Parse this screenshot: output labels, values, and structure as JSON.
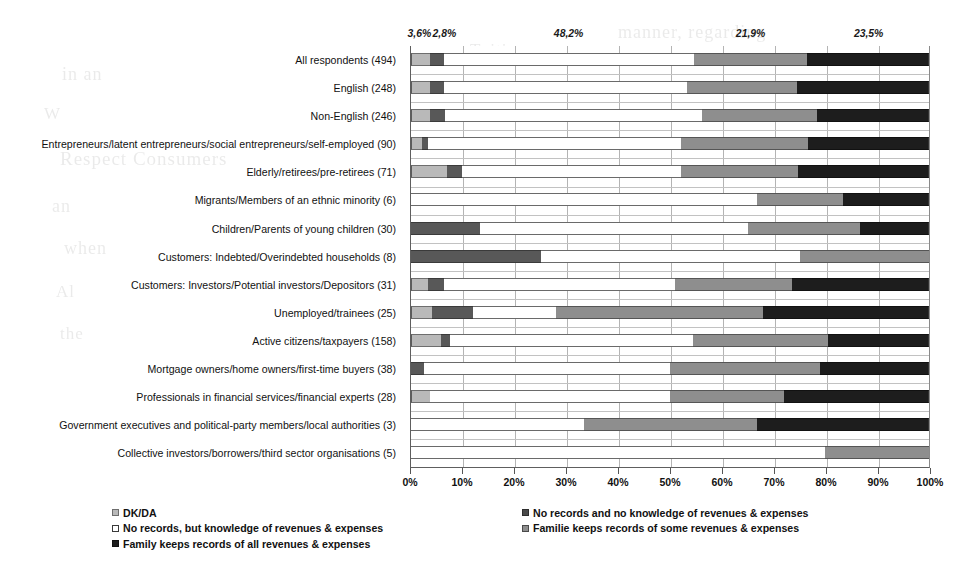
{
  "chart_data": {
    "type": "bar",
    "orientation": "horizontal",
    "stacked": true,
    "stack_mode": "percent",
    "title": "",
    "xlabel": "",
    "ylabel": "",
    "xlim": [
      0,
      100
    ],
    "xticks": [
      0,
      10,
      20,
      30,
      40,
      50,
      60,
      70,
      80,
      90,
      100
    ],
    "xtick_labels": [
      "0%",
      "10%",
      "20%",
      "30%",
      "40%",
      "50%",
      "60%",
      "70%",
      "80%",
      "90%",
      "100%"
    ],
    "grid": true,
    "legend_position": "bottom",
    "legend_entries": [
      "DK/DA",
      "No records and no knowledge of revenues & expenses",
      "No records, but knowledge of revenues & expenses",
      "Familie keeps records of some revenues & expenses",
      "Family keeps records of all revenues & expenses"
    ],
    "categories": [
      "All respondents (494)",
      "English (248)",
      "Non-English (246)",
      "Entrepreneurs/latent entrepreneurs/social entrepreneurs/self-employed (90)",
      "Elderly/retirees/pre-retirees (71)",
      "Migrants/Members of an ethnic minority (6)",
      "Children/Parents of young children (30)",
      "Customers: Indebted/Overindebted households (8)",
      "Customers: Investors/Potential investors/Depositors (31)",
      "Unemployed/trainees (25)",
      "Active citizens/taxpayers (158)",
      "Mortgage owners/home owners/first-time buyers (38)",
      "Professionals in financial services/financial experts (28)",
      "Government executives and political-party members/local authorities (3)",
      "Collective investors/borrowers/third sector organisations (5)"
    ],
    "series": [
      {
        "name": "DK/DA",
        "key": "dk",
        "color": "#b9b9b9",
        "values": [
          3.6,
          3.6,
          3.7,
          2.2,
          7.0,
          0.0,
          0.0,
          0.0,
          3.2,
          4.0,
          5.7,
          0.0,
          3.6,
          0.0,
          0.0
        ]
      },
      {
        "name": "No records and no knowledge of revenues & expenses",
        "key": "no_records_no_knowledge",
        "color": "#585858",
        "values": [
          2.8,
          2.8,
          2.8,
          1.1,
          2.8,
          0.0,
          13.3,
          25.0,
          3.2,
          8.0,
          1.9,
          2.6,
          0.0,
          0.0,
          0.0
        ]
      },
      {
        "name": "No records, but knowledge of revenues & expenses",
        "key": "no_records_but_knowledge",
        "color": "#ffffff",
        "values": [
          48.2,
          46.8,
          49.6,
          48.9,
          42.3,
          66.7,
          51.7,
          50.0,
          44.6,
          16.0,
          46.9,
          47.4,
          46.4,
          33.3,
          80.0
        ]
      },
      {
        "name": "Familie keeps records of some revenues & expenses",
        "key": "some_records",
        "color": "#8e8e8e",
        "values": [
          21.9,
          21.4,
          22.3,
          24.4,
          22.6,
          16.6,
          21.7,
          25.0,
          22.6,
          40.0,
          26.0,
          29.0,
          22.0,
          33.4,
          20.0
        ]
      },
      {
        "name": "Family keeps records of all revenues & expenses",
        "key": "all_records",
        "color": "#1d1d1d",
        "values": [
          23.5,
          25.4,
          21.6,
          23.4,
          25.3,
          16.7,
          13.3,
          0.0,
          26.4,
          32.0,
          19.5,
          21.0,
          28.0,
          33.3,
          0.0
        ]
      }
    ],
    "annotations": [
      {
        "text": "3,6%",
        "x": 1.8
      },
      {
        "text": "2,8%",
        "x": 6.6
      },
      {
        "text": "48,2%",
        "x": 30.5
      },
      {
        "text": "21,9%",
        "x": 65.5
      },
      {
        "text": "23,5%",
        "x": 88.2
      }
    ]
  },
  "ghost_text": [
    {
      "text": "manner, regarding",
      "x": 618,
      "y": 22,
      "size": 18
    },
    {
      "text": "in an",
      "x": 62,
      "y": 64,
      "size": 18
    },
    {
      "text": "Tuition",
      "x": 470,
      "y": 40,
      "size": 17
    },
    {
      "text": "W",
      "x": 44,
      "y": 104,
      "size": 17
    },
    {
      "text": "Respect Consumers",
      "x": 60,
      "y": 148,
      "size": 19
    },
    {
      "text": "their",
      "x": 560,
      "y": 120,
      "size": 17
    },
    {
      "text": "an",
      "x": 52,
      "y": 196,
      "size": 18
    },
    {
      "text": "when",
      "x": 64,
      "y": 238,
      "size": 18
    },
    {
      "text": "Al",
      "x": 56,
      "y": 282,
      "size": 17
    },
    {
      "text": "the",
      "x": 60,
      "y": 324,
      "size": 17
    },
    {
      "text": "question",
      "x": 640,
      "y": 300,
      "size": 17
    },
    {
      "text": "in the",
      "x": 520,
      "y": 332,
      "size": 17
    },
    {
      "text": "the financial",
      "x": 740,
      "y": 382,
      "size": 17
    },
    {
      "text": "of",
      "x": 880,
      "y": 424,
      "size": 17
    }
  ]
}
